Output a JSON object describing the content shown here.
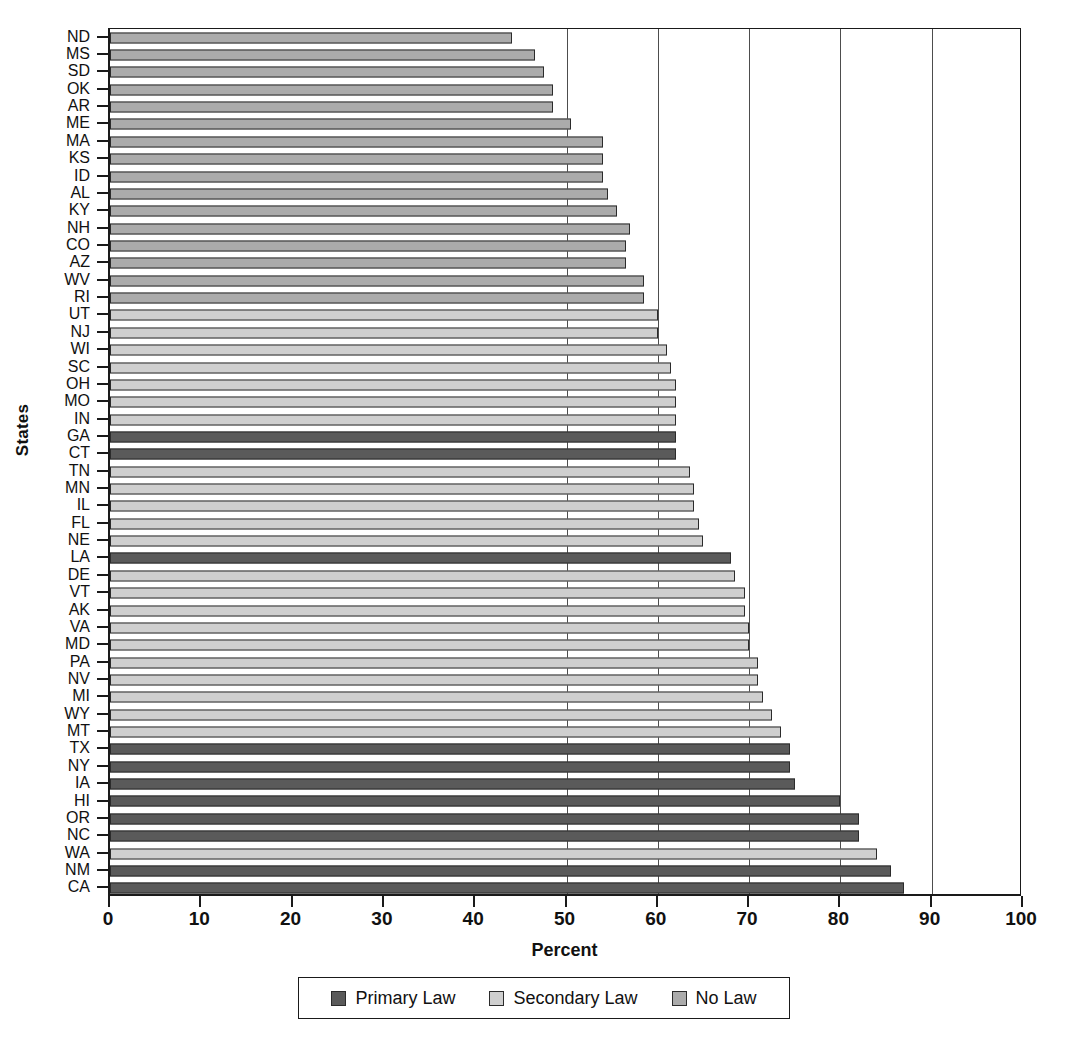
{
  "chart_data": {
    "type": "bar",
    "orientation": "horizontal",
    "title": "",
    "xlabel": "Percent",
    "ylabel": "States",
    "xlim": [
      0,
      100
    ],
    "xticks": [
      0,
      10,
      20,
      30,
      40,
      50,
      60,
      70,
      80,
      90,
      100
    ],
    "gridlines": [
      50,
      60,
      70,
      80,
      90
    ],
    "grid": true,
    "legend": {
      "position": "bottom",
      "entries": [
        {
          "name": "Primary Law",
          "color": "#5a5a5a"
        },
        {
          "name": "Secondary Law",
          "color": "#cfcfcf"
        },
        {
          "name": "No Law",
          "color": "#ababab"
        }
      ]
    },
    "categories": [
      "ND",
      "MS",
      "SD",
      "OK",
      "AR",
      "ME",
      "MA",
      "KS",
      "ID",
      "AL",
      "KY",
      "NH",
      "CO",
      "AZ",
      "WV",
      "RI",
      "UT",
      "NJ",
      "WI",
      "SC",
      "OH",
      "MO",
      "IN",
      "GA",
      "CT",
      "TN",
      "MN",
      "IL",
      "FL",
      "NE",
      "LA",
      "DE",
      "VT",
      "AK",
      "VA",
      "MD",
      "PA",
      "NV",
      "MI",
      "WY",
      "MT",
      "TX",
      "NY",
      "IA",
      "HI",
      "OR",
      "NC",
      "WA",
      "NM",
      "CA"
    ],
    "values": [
      44.0,
      46.5,
      47.5,
      48.5,
      48.5,
      50.5,
      54.0,
      54.0,
      54.0,
      54.5,
      55.5,
      57.0,
      56.5,
      56.5,
      58.5,
      58.5,
      60.0,
      60.0,
      61.0,
      61.5,
      62.0,
      62.0,
      62.0,
      62.0,
      62.0,
      63.5,
      64.0,
      64.0,
      64.5,
      65.0,
      68.0,
      68.5,
      69.5,
      69.5,
      70.0,
      70.0,
      71.0,
      71.0,
      71.5,
      72.5,
      73.5,
      74.5,
      74.5,
      75.0,
      80.0,
      82.0,
      82.0,
      84.0,
      85.5,
      87.0
    ],
    "series_category": [
      "No Law",
      "No Law",
      "No Law",
      "No Law",
      "No Law",
      "No Law",
      "No Law",
      "No Law",
      "No Law",
      "No Law",
      "No Law",
      "No Law",
      "No Law",
      "No Law",
      "No Law",
      "No Law",
      "Secondary Law",
      "Secondary Law",
      "Secondary Law",
      "Secondary Law",
      "Secondary Law",
      "Secondary Law",
      "Secondary Law",
      "Primary Law",
      "Primary Law",
      "Secondary Law",
      "Secondary Law",
      "Secondary Law",
      "Secondary Law",
      "Secondary Law",
      "Primary Law",
      "Secondary Law",
      "Secondary Law",
      "Secondary Law",
      "Secondary Law",
      "Secondary Law",
      "Secondary Law",
      "Secondary Law",
      "Secondary Law",
      "Secondary Law",
      "Secondary Law",
      "Primary Law",
      "Primary Law",
      "Primary Law",
      "Primary Law",
      "Primary Law",
      "Primary Law",
      "Secondary Law",
      "Primary Law",
      "Primary Law"
    ]
  },
  "axes": {
    "x_title": "Percent",
    "y_title": "States"
  }
}
